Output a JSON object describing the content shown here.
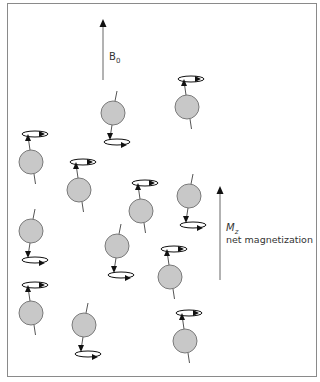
{
  "diagram": {
    "field_label": {
      "main": "B",
      "sub": "0"
    },
    "magnetization_label": {
      "main": "M",
      "sub": "z"
    },
    "magnetization_caption": "net magnetization",
    "colors": {
      "frame": "#8a8a8a",
      "sphere_fill": "#c8c8c8",
      "sphere_stroke": "#7a7a7a",
      "line": "#555555",
      "arrow": "#111111"
    },
    "spins": [
      {
        "x": 31,
        "y": 162,
        "orientation": "up"
      },
      {
        "x": 113,
        "y": 113,
        "orientation": "down"
      },
      {
        "x": 187,
        "y": 107,
        "orientation": "up"
      },
      {
        "x": 79,
        "y": 190,
        "orientation": "up"
      },
      {
        "x": 141,
        "y": 211,
        "orientation": "up"
      },
      {
        "x": 189,
        "y": 196,
        "orientation": "down"
      },
      {
        "x": 31,
        "y": 231,
        "orientation": "down"
      },
      {
        "x": 117,
        "y": 246,
        "orientation": "down"
      },
      {
        "x": 170,
        "y": 277,
        "orientation": "up"
      },
      {
        "x": 31,
        "y": 313,
        "orientation": "up"
      },
      {
        "x": 84,
        "y": 325,
        "orientation": "down"
      },
      {
        "x": 185,
        "y": 341,
        "orientation": "up"
      }
    ]
  }
}
